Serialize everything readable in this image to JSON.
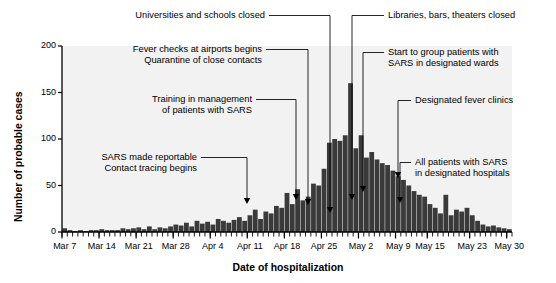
{
  "chart_data": {
    "type": "bar",
    "title": "",
    "subtitle": "",
    "xlabel": "Date of hospitalization",
    "ylabel": "Number of probable cases",
    "ylim": [
      0,
      200
    ],
    "yticks": [
      0,
      50,
      100,
      150,
      200
    ],
    "xtick_labels": [
      "Mar 7",
      "Mar 14",
      "Mar 21",
      "Mar 28",
      "Apr 4",
      "Apr 11",
      "Apr 18",
      "Apr 25",
      "May 2",
      "May 9",
      "May 15",
      "May 23",
      "May 30"
    ],
    "xtick_indices": [
      0,
      7,
      14,
      21,
      28,
      35,
      42,
      49,
      56,
      63,
      69,
      77,
      84
    ],
    "grid": false,
    "legend": null,
    "bar_color": "#3a3a3a",
    "plot_background": "#f2f2f2",
    "x_start_date": "Mar 7",
    "x_end_date": "May 30",
    "categories": [
      "Mar 7",
      "Mar 8",
      "Mar 9",
      "Mar 10",
      "Mar 11",
      "Mar 12",
      "Mar 13",
      "Mar 14",
      "Mar 15",
      "Mar 16",
      "Mar 17",
      "Mar 18",
      "Mar 19",
      "Mar 20",
      "Mar 21",
      "Mar 22",
      "Mar 23",
      "Mar 24",
      "Mar 25",
      "Mar 26",
      "Mar 27",
      "Mar 28",
      "Mar 29",
      "Mar 30",
      "Mar 31",
      "Apr 1",
      "Apr 2",
      "Apr 3",
      "Apr 4",
      "Apr 5",
      "Apr 6",
      "Apr 7",
      "Apr 8",
      "Apr 9",
      "Apr 10",
      "Apr 11",
      "Apr 12",
      "Apr 13",
      "Apr 14",
      "Apr 15",
      "Apr 16",
      "Apr 17",
      "Apr 18",
      "Apr 19",
      "Apr 20",
      "Apr 21",
      "Apr 22",
      "Apr 23",
      "Apr 24",
      "Apr 25",
      "Apr 26",
      "Apr 27",
      "Apr 28",
      "Apr 29",
      "Apr 30",
      "May 1",
      "May 2",
      "May 3",
      "May 4",
      "May 5",
      "May 6",
      "May 7",
      "May 8",
      "May 9",
      "May 10",
      "May 11",
      "May 12",
      "May 13",
      "May 14",
      "May 15",
      "May 16",
      "May 17",
      "May 18",
      "May 19",
      "May 20",
      "May 21",
      "May 22",
      "May 23",
      "May 24",
      "May 25",
      "May 26",
      "May 27",
      "May 28",
      "May 29",
      "May 30"
    ],
    "values": [
      4,
      2,
      1,
      2,
      1,
      2,
      2,
      3,
      2,
      2,
      2,
      4,
      3,
      4,
      5,
      3,
      6,
      3,
      5,
      4,
      6,
      8,
      7,
      10,
      6,
      12,
      9,
      11,
      8,
      14,
      12,
      10,
      13,
      16,
      12,
      18,
      24,
      14,
      22,
      20,
      28,
      26,
      42,
      30,
      46,
      34,
      38,
      52,
      50,
      68,
      96,
      100,
      98,
      104,
      160,
      90,
      104,
      80,
      86,
      78,
      74,
      72,
      66,
      60,
      56,
      50,
      44,
      40,
      38,
      30,
      26,
      20,
      40,
      18,
      24,
      22,
      26,
      18,
      12,
      8,
      6,
      7,
      5,
      4,
      3
    ]
  },
  "annotations": [
    {
      "id": "universities-schools-closed",
      "lines": [
        "Universities and schools closed"
      ],
      "align": "right",
      "target_date": "Apr 25"
    },
    {
      "id": "libraries-bars-theaters-closed",
      "lines": [
        "Libraries, bars, theaters closed"
      ],
      "align": "left",
      "target_date": "Apr 26"
    },
    {
      "id": "fever-checks-airports",
      "lines": [
        "Fever checks at airports begins",
        "Quarantine of close contacts"
      ],
      "align": "right",
      "target_date": "Apr 20"
    },
    {
      "id": "group-patients-designated-wards",
      "lines": [
        "Start to group patients with",
        "SARS in designated wards"
      ],
      "align": "left",
      "target_date": "Apr 28"
    },
    {
      "id": "training-management-patients",
      "lines": [
        "Training in management",
        "of patients with SARS"
      ],
      "align": "right",
      "target_date": "Apr 18"
    },
    {
      "id": "designated-fever-clinics",
      "lines": [
        "Designated fever clinics"
      ],
      "align": "left",
      "target_date": "Apr 30"
    },
    {
      "id": "sars-made-reportable",
      "lines": [
        "SARS made reportable",
        "Contact tracing begins"
      ],
      "align": "right",
      "target_date": "Apr 10"
    },
    {
      "id": "all-patients-designated-hospitals",
      "lines": [
        "All patients with SARS",
        "in designated hospitals"
      ],
      "align": "left",
      "target_date": "May 6"
    }
  ]
}
